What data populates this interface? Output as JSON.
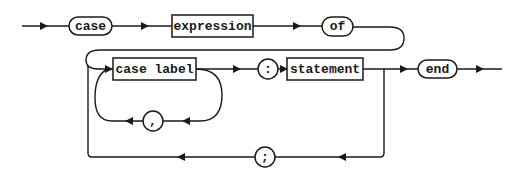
{
  "diagram": {
    "type": "syntax-diagram",
    "rule": "case statement",
    "terminals": [
      {
        "id": "case",
        "label": "case",
        "shape": "stadium"
      },
      {
        "id": "of",
        "label": "of",
        "shape": "stadium"
      },
      {
        "id": "colon",
        "label": ":",
        "shape": "circle"
      },
      {
        "id": "comma",
        "label": ",",
        "shape": "circle"
      },
      {
        "id": "semicolon",
        "label": ";",
        "shape": "circle"
      },
      {
        "id": "end",
        "label": "end",
        "shape": "stadium"
      }
    ],
    "nonterminals": [
      {
        "id": "expression",
        "label": "expression",
        "shape": "rectangle"
      },
      {
        "id": "case_label",
        "label": "case label",
        "shape": "rectangle"
      },
      {
        "id": "statement",
        "label": "statement",
        "shape": "rectangle"
      }
    ],
    "sequence": [
      "case",
      "expression",
      "of",
      "case_label",
      "colon",
      "statement",
      "end"
    ],
    "loops": [
      {
        "from": "case_label",
        "back_to": "case_label",
        "via": "comma"
      },
      {
        "from": "statement",
        "back_to": "case_label",
        "via": "semicolon"
      }
    ],
    "colors": {
      "stroke": "#1a1a1a",
      "background": "#ffffff"
    }
  }
}
